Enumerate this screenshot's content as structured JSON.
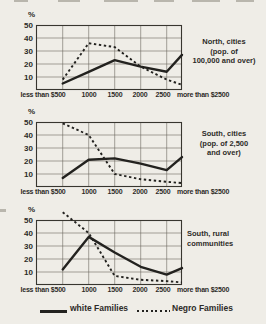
{
  "palette": {
    "paper": "#efede7",
    "ink": "#23221f"
  },
  "axis": {
    "percent_symbol": "%",
    "y_ticks": [
      "50",
      "40",
      "30",
      "20",
      "10"
    ],
    "x_ticks": [
      "less than $500",
      "1000",
      "1500",
      "2000",
      "2500",
      "more than $2500"
    ]
  },
  "legend": {
    "white_label": "white Families",
    "negro_label": "Negro Families"
  },
  "chart_data": [
    {
      "type": "line",
      "title": "North, cities (pop. of 100,000 and over)",
      "title_lines": [
        "North, cities",
        "(pop. of",
        "100,000 and over)"
      ],
      "categories": [
        "less than $500",
        "1000",
        "1500",
        "2000",
        "2500",
        "more than $2500"
      ],
      "xlabel": "family income",
      "ylabel": "%",
      "ylim": [
        0,
        50
      ],
      "grid": true,
      "series": [
        {
          "name": "white Families",
          "style": "solid",
          "values": [
            5,
            14,
            23,
            18,
            14,
            27
          ]
        },
        {
          "name": "Negro Families",
          "style": "dotted",
          "values": [
            8,
            36,
            33,
            18,
            8,
            4
          ]
        }
      ]
    },
    {
      "type": "line",
      "title": "South, cities (pop. of 2,500 and over)",
      "title_lines": [
        "South, cities",
        "(pop. of 2,500",
        "and over)"
      ],
      "categories": [
        "less than $500",
        "1000",
        "1500",
        "2000",
        "2500",
        "more than $2500"
      ],
      "xlabel": "family income",
      "ylabel": "%",
      "ylim": [
        0,
        50
      ],
      "grid": true,
      "series": [
        {
          "name": "white Families",
          "style": "solid",
          "values": [
            7,
            21,
            22,
            18,
            13,
            23
          ]
        },
        {
          "name": "Negro Families",
          "style": "dotted",
          "values": [
            49,
            40,
            10,
            6,
            4,
            3
          ]
        }
      ]
    },
    {
      "type": "line",
      "title": "South, rural communities",
      "title_lines": [
        "South, rural",
        "communities"
      ],
      "categories": [
        "less than $500",
        "1000",
        "1500",
        "2000",
        "2500",
        "more than $2500"
      ],
      "xlabel": "family income",
      "ylabel": "%",
      "ylim": [
        0,
        50
      ],
      "grid": true,
      "series": [
        {
          "name": "white Families",
          "style": "solid",
          "values": [
            12,
            37,
            25,
            14,
            8,
            13
          ]
        },
        {
          "name": "Negro Families",
          "style": "dotted",
          "values": [
            56,
            40,
            7,
            4,
            3,
            2
          ]
        }
      ]
    }
  ]
}
